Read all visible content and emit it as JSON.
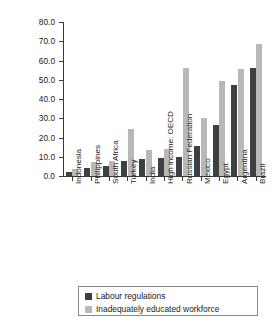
{
  "chart_data": {
    "type": "bar",
    "title": "",
    "xlabel": "",
    "ylabel": "Percent of firms identifying as a major constraint",
    "ylim": [
      0,
      80
    ],
    "ytick_labels": [
      "80.0",
      "70.0",
      "60.0",
      "50.0",
      "40.0",
      "30.0",
      "20.0",
      "10.0",
      "0.0"
    ],
    "ytick_values": [
      80,
      70,
      60,
      50,
      40,
      30,
      20,
      10,
      0
    ],
    "grid": false,
    "legend_position": "bottom",
    "categories": [
      "Indonesia",
      "Philippines",
      "South Africa",
      "Turkey",
      "India",
      "High income: OECD",
      "Russian Federation",
      "Mexico",
      "Egypt",
      "Argentina",
      "Brazil"
    ],
    "series": [
      {
        "name": "Labour regulations",
        "color": "#3f3f3f",
        "values": [
          2.0,
          4.2,
          5.3,
          7.7,
          8.6,
          9.3,
          10.0,
          15.8,
          26.4,
          47.2,
          56.3
        ]
      },
      {
        "name": "Inadequately educated workforce",
        "color": "#b8b8b8",
        "values": [
          3.6,
          7.1,
          8.0,
          24.4,
          13.7,
          13.8,
          56.2,
          30.2,
          49.4,
          55.8,
          68.4
        ]
      }
    ]
  },
  "legend": {
    "items": [
      {
        "label": "Labour regulations",
        "color": "#3f3f3f"
      },
      {
        "label": "Inadequately educated workforce",
        "color": "#b8b8b8"
      }
    ]
  },
  "axis": {
    "y_title": "Percent of firms identifying as a major constraint"
  }
}
